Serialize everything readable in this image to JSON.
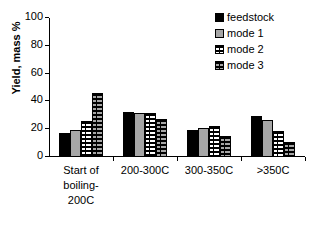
{
  "chart_data": {
    "type": "bar",
    "title": "",
    "xlabel": "",
    "ylabel": "Yield, mass %",
    "ylim": [
      0,
      100
    ],
    "yticks": [
      0,
      20,
      40,
      60,
      80,
      100
    ],
    "grid": false,
    "legend_position": "top-right",
    "categories": [
      "Start of\nboiling-\n200C",
      "200-300C",
      "300-350C",
      ">350C"
    ],
    "series": [
      {
        "name": "feedstock",
        "fill": "solid-black",
        "color": "#000000",
        "values": [
          17.5,
          32.5,
          19.5,
          29.5
        ]
      },
      {
        "name": "mode 1",
        "fill": "solid-gray",
        "color": "#a6a6a6",
        "values": [
          19.5,
          31.5,
          21.0,
          26.5
        ]
      },
      {
        "name": "mode 2",
        "fill": "white-dashed",
        "color": "#ffffff",
        "values": [
          26.0,
          31.5,
          22.5,
          18.5
        ]
      },
      {
        "name": "mode 3",
        "fill": "gray-dashed",
        "color": "#a6a6a6",
        "values": [
          46.0,
          27.0,
          15.0,
          10.5
        ]
      }
    ]
  },
  "legend": {
    "items": [
      {
        "label": "feedstock",
        "swatch": "swatch-feedstock"
      },
      {
        "label": "mode 1",
        "swatch": "swatch-mode-1"
      },
      {
        "label": "mode 2",
        "swatch": "swatch-mode-2"
      },
      {
        "label": "mode 3",
        "swatch": "swatch-mode-3"
      }
    ]
  },
  "axes": {
    "y_title": "Yield, mass %",
    "y_tick_labels": [
      "0",
      "20",
      "40",
      "60",
      "80",
      "100"
    ],
    "x_tick_labels": [
      "Start of\nboiling-\n200C",
      "200-300C",
      "300-350C",
      ">350C"
    ]
  }
}
